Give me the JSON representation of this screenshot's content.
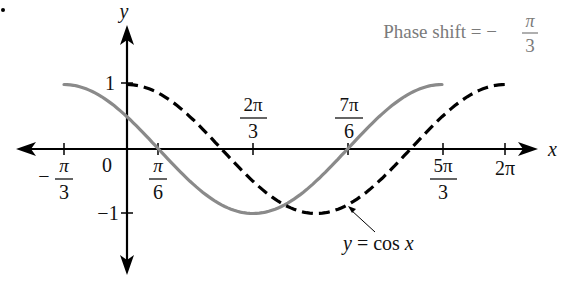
{
  "chart_data": {
    "type": "line",
    "title": "",
    "annotation": "Phase shift = − π/3",
    "xlabel": "x",
    "ylabel": "y",
    "xlim": [
      -1.2,
      6.5
    ],
    "ylim": [
      -1.9,
      1.6
    ],
    "grid": false,
    "x_ticks": [
      {
        "value": -1.0472,
        "num": "π",
        "den": "3",
        "sign": "−"
      },
      {
        "value": 0.5236,
        "num": "π",
        "den": "6",
        "sign": ""
      },
      {
        "value": 2.0944,
        "num": "2π",
        "den": "3",
        "sign": ""
      },
      {
        "value": 3.6652,
        "num": "7π",
        "den": "6",
        "sign": ""
      },
      {
        "value": 5.236,
        "num": "5π",
        "den": "3",
        "sign": ""
      },
      {
        "value": 6.2832,
        "label": "2π"
      }
    ],
    "y_ticks": [
      {
        "value": 1,
        "label": "1"
      },
      {
        "value": -1,
        "label": "−1"
      }
    ],
    "origin_label": "0",
    "series": [
      {
        "name": "y = cos(x + π/3)",
        "style": "solid",
        "color": "#808080",
        "x_range": [
          -1.0472,
          5.236
        ],
        "function": "cos(x + pi/3)"
      },
      {
        "name": "y = cos x",
        "style": "dashed",
        "color": "#000000",
        "x_range": [
          0,
          6.2832
        ],
        "function": "cos(x)"
      }
    ],
    "callout": {
      "text": "y = cos x",
      "points_to_x": 4.19
    }
  },
  "labels": {
    "phase_shift_prefix": "Phase shift = −",
    "phase_num": "π",
    "phase_den": "3",
    "x_axis": "x",
    "y_axis": "y",
    "origin": "0",
    "y_one": "1",
    "y_neg_one": "−1",
    "callout_y": "y",
    "callout_rest": " = cos ",
    "callout_x": "x",
    "tick_neg_pi3_sign": "−",
    "tick_neg_pi3_num": "π",
    "tick_neg_pi3_den": "3",
    "tick_pi6_num": "π",
    "tick_pi6_den": "6",
    "tick_2pi3_num": "2π",
    "tick_2pi3_den": "3",
    "tick_7pi6_num": "7π",
    "tick_7pi6_den": "6",
    "tick_5pi3_num": "5π",
    "tick_5pi3_den": "3",
    "tick_2pi": "2π"
  }
}
